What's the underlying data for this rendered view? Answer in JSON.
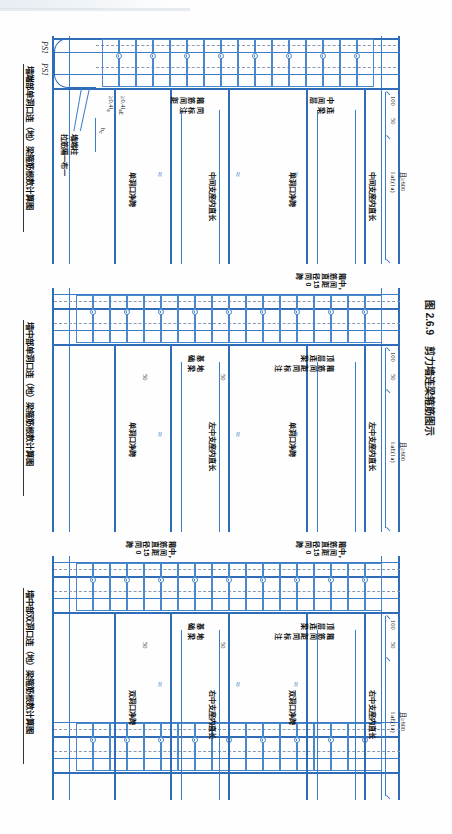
{
  "figure": {
    "number": "图 2.6.9",
    "title": "剪力墙连梁箍筋图示",
    "caption_full": "图 2.6.9  剪力墙连梁箍筋图示"
  },
  "subfigures": [
    {
      "id": "a",
      "caption": "墙中部双洞口连（地）梁箍筋根数计算图"
    },
    {
      "id": "b",
      "caption": "墙中部单洞口连（地）梁箍筋根数计算图"
    },
    {
      "id": "c",
      "caption": "墙端部单洞口连（地）梁箍筋根数计算图"
    }
  ],
  "labels": {
    "top_beam_title": "顶层连梁",
    "top_beam_sub": "箍筋间距同标注",
    "mid_beam_title": "中间层",
    "mid_beam_title2": "连梁",
    "mid_beam_sub": "箍筋间距同标注",
    "foundation_title": "基础",
    "foundation_title2": "地梁",
    "stirrup_spacing_note": "箍筋间距",
    "stirrup_spacing_note2": "同标注",
    "wall_stirrup_note_1": "箍筋直径同跨",
    "wall_stirrup_note_2": "中，间距150",
    "left_support_len": "左中支座内直长",
    "right_support_len": "右中支座内直长",
    "mid_support_len": "中间支座内直长",
    "support_len": "支座内直长",
    "double_hole_clear_span": "双洞口净跨",
    "single_hole_clear_span": "单洞口净跨",
    "wall_end_col": "墙端柱",
    "tie_note": "拉筋隔一布一",
    "ps1": "PS1"
  },
  "dimensions": {
    "d100": "100",
    "d50": "50",
    "lae": "l",
    "lae_sub": "aE",
    "lae_alt": "(l",
    "lae_alt_sub": "a",
    "lae_alt_end": ")",
    "lae_full": "l aE(l a)",
    "ge600": "且≥600",
    "ge04lae": "≥0.4l",
    "ge04lae_sub": "aE",
    "ge04la": "≥0.4l",
    "ge04la_sub": "a",
    "hc": "h",
    "hc_sub": "c",
    "spacing150": "150"
  },
  "colors": {
    "line": "#3b7cc4",
    "line_light": "#7aa9d8",
    "line_dark": "#2f6db8",
    "dashed": "#8a9ab0",
    "text": "#111111",
    "paper": "#ffffff"
  }
}
